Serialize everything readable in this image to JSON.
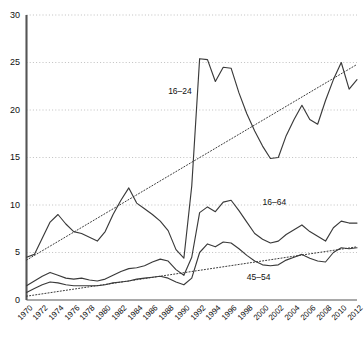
{
  "chart_data": {
    "type": "line",
    "title": "",
    "xlabel": "",
    "ylabel": "",
    "xlim": [
      1970,
      2012
    ],
    "ylim": [
      0,
      30
    ],
    "yticks": [
      0,
      5,
      10,
      15,
      20,
      25,
      30
    ],
    "xticks": [
      1970,
      1972,
      1974,
      1976,
      1978,
      1980,
      1982,
      1984,
      1986,
      1988,
      1990,
      1992,
      1994,
      1996,
      1998,
      2000,
      2002,
      2004,
      2006,
      2008,
      2010,
      2012
    ],
    "grid": "horizontal-dotted",
    "legend_position": "inline-annotations",
    "x": [
      1970,
      1971,
      1972,
      1973,
      1974,
      1975,
      1976,
      1977,
      1978,
      1979,
      1980,
      1981,
      1982,
      1983,
      1984,
      1985,
      1986,
      1987,
      1988,
      1989,
      1990,
      1991,
      1992,
      1993,
      1994,
      1995,
      1996,
      1997,
      1998,
      1999,
      2000,
      2001,
      2002,
      2003,
      2004,
      2005,
      2006,
      2007,
      2008,
      2009,
      2010,
      2011,
      2012
    ],
    "series": [
      {
        "name": "16-24",
        "style": "solid",
        "label": "16–24",
        "values": [
          4.5,
          4.8,
          6.5,
          8.2,
          9.0,
          8.0,
          7.2,
          7.0,
          6.6,
          6.2,
          7.2,
          9.0,
          10.5,
          11.8,
          10.2,
          9.6,
          9.0,
          8.3,
          7.3,
          5.3,
          4.4,
          12.0,
          25.4,
          25.3,
          23.0,
          24.5,
          24.4,
          21.8,
          19.6,
          17.8,
          16.2,
          14.9,
          15.0,
          17.3,
          19.0,
          20.5,
          19.0,
          18.5,
          21.0,
          23.2,
          25.0,
          22.2,
          23.2
        ]
      },
      {
        "name": "16-64",
        "style": "solid",
        "label": "16–64",
        "values": [
          1.5,
          2.0,
          2.5,
          2.9,
          2.6,
          2.3,
          2.2,
          2.3,
          2.1,
          2.0,
          2.2,
          2.6,
          3.0,
          3.3,
          3.4,
          3.6,
          4.0,
          4.3,
          4.1,
          3.2,
          2.6,
          4.5,
          9.2,
          9.8,
          9.3,
          10.3,
          10.5,
          9.4,
          8.2,
          7.0,
          6.4,
          6.0,
          6.2,
          6.9,
          7.4,
          7.9,
          7.2,
          6.7,
          6.2,
          7.6,
          8.3,
          8.1,
          8.1
        ]
      },
      {
        "name": "45-54",
        "style": "solid",
        "label": "45–54",
        "values": [
          0.8,
          1.2,
          1.6,
          1.9,
          1.8,
          1.6,
          1.5,
          1.5,
          1.5,
          1.5,
          1.6,
          1.8,
          1.9,
          2.0,
          2.2,
          2.3,
          2.4,
          2.5,
          2.3,
          1.9,
          1.6,
          2.3,
          5.0,
          5.9,
          5.6,
          6.1,
          6.0,
          5.4,
          4.7,
          4.1,
          3.7,
          3.6,
          3.7,
          4.2,
          4.5,
          4.8,
          4.4,
          4.1,
          4.0,
          5.0,
          5.5,
          5.4,
          5.5
        ]
      }
    ],
    "trendlines": [
      {
        "name": "trend-upper",
        "style": "dotted",
        "points": [
          [
            1970,
            4.2
          ],
          [
            2012,
            24.8
          ]
        ]
      },
      {
        "name": "trend-lower",
        "style": "dotted",
        "points": [
          [
            1970,
            0.4
          ],
          [
            2012,
            5.6
          ]
        ]
      }
    ],
    "annotations": [
      {
        "text": "16–24",
        "x": 1988,
        "y": 22.0,
        "name": "series-annotation-16-24"
      },
      {
        "text": "16–64",
        "x": 2000,
        "y": 10.3,
        "name": "series-annotation-16-64"
      },
      {
        "text": "45–54",
        "x": 1998,
        "y": 2.4,
        "name": "series-annotation-45-54"
      }
    ],
    "colors": {
      "line": "#3a3a3a",
      "grid": "#b9b9b9",
      "axis": "#555555",
      "text": "#111111",
      "background": "#ffffff"
    }
  }
}
